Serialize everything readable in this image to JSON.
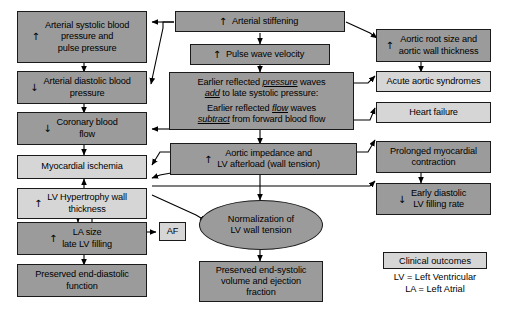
{
  "diagram": {
    "colors": {
      "dark_node": "#9b9b9b",
      "light_node": "#d6d6d6",
      "border": "#1a1a1a",
      "background": "#ffffff",
      "text": "#000000"
    },
    "nodes": [
      {
        "id": "arterial-systolic",
        "label": "Arterial systolic blood\npressure and\npulse pressure",
        "arrow": "↑",
        "shade": "dark"
      },
      {
        "id": "arterial-stiffening",
        "label": "Arterial stiffening",
        "arrow": "↑",
        "shade": "dark"
      },
      {
        "id": "aortic-root",
        "label": "Aortic root size and\naortic wall thickness",
        "arrow": "↑",
        "shade": "dark"
      },
      {
        "id": "pulse-wave-velocity",
        "label": "Pulse wave velocity",
        "arrow": "↑",
        "shade": "dark"
      },
      {
        "id": "arterial-diastolic",
        "label": "Arterial diastolic blood\npressure",
        "arrow": "↓",
        "shade": "dark"
      },
      {
        "id": "reflected-waves",
        "line1a": "Earlier reflected ",
        "line1b": "pressure",
        "line1c": " waves",
        "line2a": "add",
        "line2b": " to late systolic pressure:",
        "line3a": "Earlier reflected ",
        "line3b": "flow",
        "line3c": " waves",
        "line4a": "subtract",
        "line4b": " from forward blood flow",
        "shade": "dark"
      },
      {
        "id": "acute-aortic-syndromes",
        "label": "Acute aortic syndromes",
        "shade": "light"
      },
      {
        "id": "coronary-blood-flow",
        "label": "Coronary blood\nflow",
        "arrow": "↓",
        "shade": "dark"
      },
      {
        "id": "heart-failure",
        "label": "Heart failure",
        "shade": "light"
      },
      {
        "id": "prolonged-myocardial",
        "label": "Prolonged myocardial\ncontraction",
        "shade": "dark"
      },
      {
        "id": "myocardial-ischemia",
        "label": "Myocardial ischemia",
        "shade": "light"
      },
      {
        "id": "aortic-impedance",
        "label": "Aortic impedance and\nLV afterload (wall tension)",
        "arrow": "↑",
        "shade": "dark"
      },
      {
        "id": "lv-hypertrophy",
        "label": "LV Hypertrophy wall\nthickness",
        "arrow": "↑",
        "shade": "light"
      },
      {
        "id": "early-diastolic",
        "label": "Early diastolic\nLV filling rate",
        "arrow": "↓",
        "shade": "dark"
      },
      {
        "id": "la-size",
        "label": "LA size\nlate LV filling",
        "arrow": "↑",
        "shade": "dark"
      },
      {
        "id": "af",
        "label": "AF",
        "shade": "light"
      },
      {
        "id": "normalization",
        "label": "Normalization of\nLV wall tension",
        "shade": "dark"
      },
      {
        "id": "preserved-end-diastolic",
        "label": "Preserved end-diastolic\nfunction",
        "shade": "dark"
      },
      {
        "id": "preserved-end-systolic",
        "label": "Preserved end-systolic\nvolume and ejection\nfraction",
        "shade": "dark"
      }
    ],
    "legend": {
      "box_label": "Clinical outcomes",
      "abbreviations": "LV = Left Ventricular\nLA = Left Atrial"
    }
  }
}
